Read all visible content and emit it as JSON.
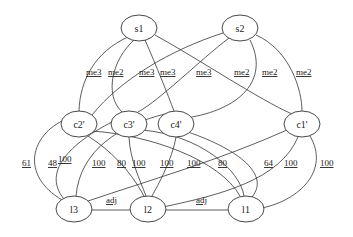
{
  "title": "",
  "nodes": [
    {
      "id": "s1",
      "label": "s1",
      "x": 139,
      "y": 28
    },
    {
      "id": "s2",
      "label": "s2",
      "x": 240,
      "y": 28
    },
    {
      "id": "c2",
      "label": "c2'",
      "x": 79,
      "y": 124
    },
    {
      "id": "c3",
      "label": "c3'",
      "x": 129,
      "y": 124
    },
    {
      "id": "c4",
      "label": "c4'",
      "x": 176,
      "y": 124
    },
    {
      "id": "c1",
      "label": "c1'",
      "x": 302,
      "y": 124
    },
    {
      "id": "l3",
      "label": "l3",
      "x": 74,
      "y": 209
    },
    {
      "id": "l2",
      "label": "l2",
      "x": 148,
      "y": 209
    },
    {
      "id": "l1",
      "label": "l1",
      "x": 246,
      "y": 209
    }
  ],
  "edges": [
    {
      "from": "s1",
      "to": "c2",
      "label": "me3",
      "lx": 86,
      "ly": 75,
      "d": "M128,37 C95,52 80,80 79,111"
    },
    {
      "from": "s1",
      "to": "c3",
      "label": "me2",
      "lx": 108,
      "ly": 75,
      "d": "M134,40 C112,60 104,95 122,112"
    },
    {
      "from": "s1",
      "to": "c4",
      "label": "me3",
      "lx": 160,
      "ly": 75,
      "d": "M145,40 C156,65 168,95 174,111"
    },
    {
      "from": "s1",
      "to": "c1",
      "label": "me2",
      "lx": 234,
      "ly": 75,
      "d": "M155,35 C200,60 260,100 292,114"
    },
    {
      "from": "s2",
      "to": "c2",
      "label": "me3",
      "lx": 139,
      "ly": 75,
      "d": "M223,33 C170,50 120,80 92,115"
    },
    {
      "from": "s2",
      "to": "c3",
      "label": "me3",
      "lx": 196,
      "ly": 75,
      "d": "M229,38 C200,60 160,100 138,112"
    },
    {
      "from": "s2",
      "to": "c4",
      "label": "me2",
      "lx": 262,
      "ly": 75,
      "d": "M250,40 C270,80 240,110 186,118"
    },
    {
      "from": "s2",
      "to": "c1",
      "label": "me2",
      "lx": 296,
      "ly": 75,
      "d": "M256,35 C290,50 302,90 302,111"
    },
    {
      "from": "c2",
      "to": "l3",
      "label": "61",
      "lx": 22,
      "ly": 166,
      "d": "M66,119 C30,135 20,175 62,200"
    },
    {
      "from": "c3",
      "to": "l3",
      "label": "48",
      "lx": 48,
      "ly": 166,
      "d": "M116,120 C75,140 40,170 64,199"
    },
    {
      "from": "c4",
      "to": "l3",
      "label": "100",
      "lx": 92,
      "ly": 166,
      "d": "M165,114 C120,125 80,150 76,196"
    },
    {
      "from": "c2",
      "to": "l2",
      "label": "80",
      "lx": 117,
      "ly": 166,
      "d": "M88,136 C110,150 130,170 144,196"
    },
    {
      "from": "c3",
      "to": "l2",
      "label": "100",
      "lx": 132,
      "ly": 166,
      "d": "M129,137 C130,160 140,180 146,196"
    },
    {
      "from": "c4",
      "to": "l2",
      "label": "100",
      "lx": 160,
      "ly": 166,
      "d": "M176,137 C172,160 158,185 152,196"
    },
    {
      "from": "c1",
      "to": "l3",
      "label": "100",
      "lx": 187,
      "ly": 166,
      "d": "M287,130 C220,160 150,180 88,201"
    },
    {
      "from": "c2",
      "to": "l1",
      "label": "100",
      "lx": 58,
      "ly": 162,
      "d": "M92,131 C150,135 220,160 240,196"
    },
    {
      "from": "c3",
      "to": "l1",
      "label": "80",
      "lx": 218,
      "ly": 166,
      "d": "M142,130 C200,135 240,170 244,196"
    },
    {
      "from": "c4",
      "to": "l1",
      "label": "64",
      "lx": 264,
      "ly": 166,
      "d": "M188,132 C240,150 270,175 252,197"
    },
    {
      "from": "c1",
      "to": "l2",
      "label": "100",
      "lx": 284,
      "ly": 166,
      "d": "M298,137 C280,180 220,195 163,207"
    },
    {
      "from": "c1",
      "to": "l1",
      "label": "100",
      "lx": 320,
      "ly": 166,
      "d": "M310,136 C330,170 300,200 262,208"
    },
    {
      "from": "l2",
      "to": "l3",
      "label": "adj",
      "lx": 106,
      "ly": 203,
      "d": "M130,210 L92,210"
    },
    {
      "from": "l1",
      "to": "l2",
      "label": "adj",
      "lx": 196,
      "ly": 203,
      "d": "M228,210 L166,210"
    }
  ]
}
